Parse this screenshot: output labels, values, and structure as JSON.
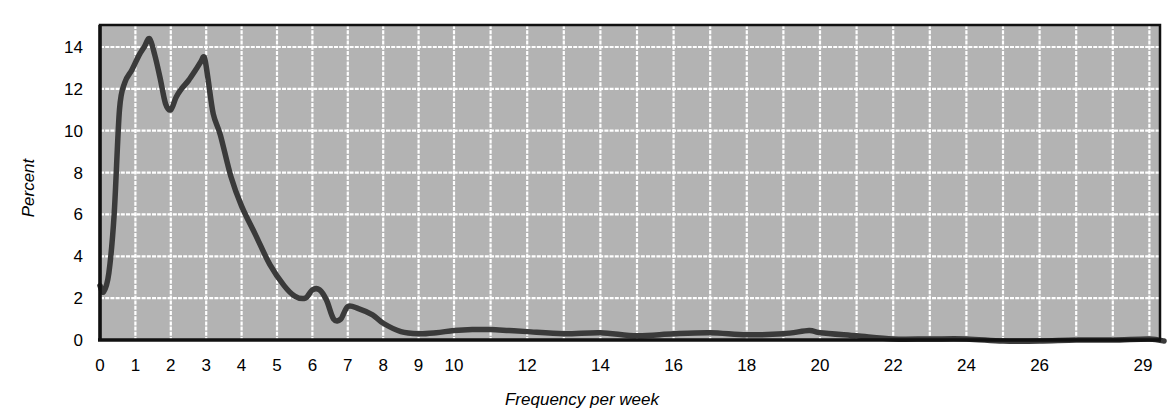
{
  "chart_data": {
    "type": "line",
    "title": "",
    "xlabel": "Frequency per week",
    "ylabel": "Percent",
    "ylim": [
      0,
      14.5
    ],
    "xlim": [
      0,
      29.5
    ],
    "grid": true,
    "legend": "none",
    "y_ticks": [
      0,
      2,
      4,
      6,
      8,
      10,
      12,
      14
    ],
    "x_tick_labels": [
      "0",
      "1",
      "2",
      "3",
      "4",
      "5",
      "6",
      "7",
      "8",
      "9",
      "10",
      "12",
      "14",
      "16",
      "18",
      "20",
      "22",
      "24",
      "26",
      "29"
    ],
    "series": [
      {
        "name": "Frequency distribution",
        "x": [
          0,
          0.1,
          0.25,
          0.4,
          0.55,
          0.7,
          0.9,
          1.1,
          1.25,
          1.4,
          1.55,
          1.7,
          1.85,
          2.0,
          2.15,
          2.3,
          2.5,
          2.7,
          2.85,
          2.95,
          3.05,
          3.2,
          3.4,
          3.7,
          4.0,
          4.4,
          4.8,
          5.2,
          5.5,
          5.8,
          6.0,
          6.2,
          6.4,
          6.6,
          6.8,
          7.0,
          7.3,
          7.7,
          8.0,
          8.5,
          9.0,
          9.5,
          10.0,
          10.5,
          11.0,
          11.5,
          12.0,
          13.0,
          14.0,
          15.0,
          16.0,
          17.0,
          18.0,
          19.0,
          19.7,
          20.0,
          21.0,
          22.0,
          23.0,
          24.0,
          25.0,
          26.0,
          27.0,
          28.0,
          29.0,
          29.4
        ],
        "values": [
          2.6,
          2.3,
          3.2,
          6.0,
          11.0,
          12.3,
          12.9,
          13.6,
          14.0,
          14.4,
          13.6,
          12.5,
          11.3,
          11.0,
          11.6,
          12.0,
          12.4,
          12.9,
          13.3,
          13.5,
          12.5,
          10.8,
          9.8,
          7.8,
          6.4,
          5.0,
          3.6,
          2.6,
          2.1,
          2.0,
          2.4,
          2.4,
          1.9,
          1.0,
          1.0,
          1.6,
          1.5,
          1.2,
          0.8,
          0.4,
          0.3,
          0.35,
          0.45,
          0.5,
          0.5,
          0.45,
          0.4,
          0.3,
          0.35,
          0.2,
          0.3,
          0.35,
          0.25,
          0.3,
          0.45,
          0.35,
          0.2,
          0.05,
          0.05,
          0.05,
          -0.05,
          -0.05,
          0.0,
          0.0,
          0.05,
          -0.05
        ]
      }
    ],
    "colors": {
      "plot_background": "#b3b3b3",
      "gridline": "#ffffff",
      "line": "#3a3a3a",
      "axis": "#111111"
    }
  }
}
